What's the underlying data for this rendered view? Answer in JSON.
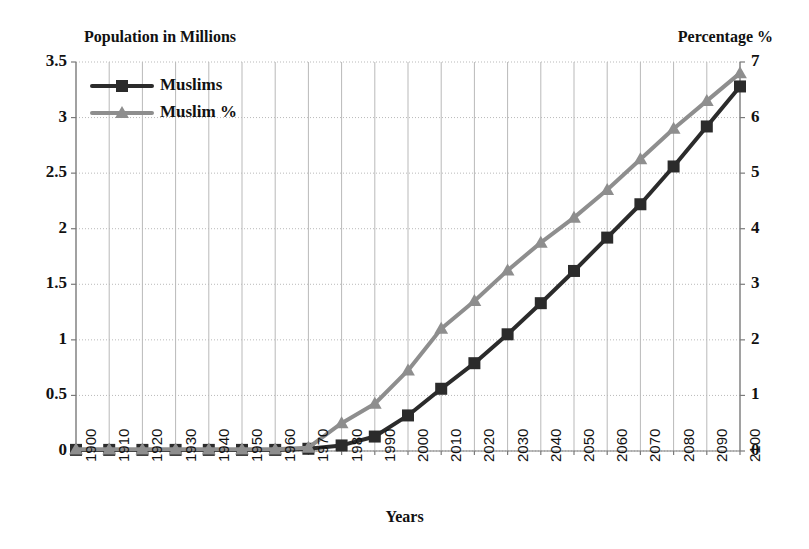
{
  "chart_data": {
    "type": "line",
    "title": "",
    "xlabel": "Years",
    "ylabel": "Population in Millions",
    "y2label": "Percentage %",
    "grid": true,
    "legend_position": "top-left-inside",
    "xlim": [
      1900,
      2100
    ],
    "ylim": [
      0,
      3.5
    ],
    "y2lim": [
      0,
      7
    ],
    "yticks": [
      "0",
      "0.5",
      "1",
      "1.5",
      "2",
      "2.5",
      "3",
      "3.5"
    ],
    "ytick_values": [
      0,
      0.5,
      1,
      1.5,
      2,
      2.5,
      3,
      3.5
    ],
    "y2ticks": [
      "0",
      "1",
      "2",
      "3",
      "4",
      "5",
      "6",
      "7"
    ],
    "y2tick_values": [
      0,
      1,
      2,
      3,
      4,
      5,
      6,
      7
    ],
    "categories": [
      "1900",
      "1910",
      "1920",
      "1930",
      "1940",
      "1950",
      "1960",
      "1970",
      "1980",
      "1990",
      "2000",
      "2010",
      "2020",
      "2030",
      "2040",
      "2050",
      "2060",
      "2070",
      "2080",
      "2090",
      "2100"
    ],
    "x": [
      1900,
      1910,
      1920,
      1930,
      1940,
      1950,
      1960,
      1970,
      1980,
      1990,
      2000,
      2010,
      2020,
      2030,
      2040,
      2050,
      2060,
      2070,
      2080,
      2090,
      2100
    ],
    "series": [
      {
        "name": "Muslims",
        "axis": "left",
        "color": "#2b2b2b",
        "marker": "square",
        "unit": "millions",
        "values": [
          0.01,
          0.01,
          0.01,
          0.01,
          0.01,
          0.01,
          0.01,
          0.02,
          0.05,
          0.13,
          0.32,
          0.56,
          0.79,
          1.05,
          1.33,
          1.62,
          1.92,
          2.22,
          2.56,
          2.92,
          3.28
        ]
      },
      {
        "name": "Muslim %",
        "axis": "right",
        "color": "#8e8e8e",
        "marker": "triangle",
        "unit": "percent",
        "values": [
          0.03,
          0.03,
          0.03,
          0.03,
          0.03,
          0.03,
          0.03,
          0.06,
          0.5,
          0.85,
          1.45,
          2.2,
          2.7,
          3.25,
          3.75,
          4.2,
          4.7,
          5.25,
          5.8,
          6.3,
          6.8
        ]
      }
    ]
  },
  "legend": {
    "items": [
      {
        "label": "Muslims",
        "color": "#2b2b2b",
        "marker": "square"
      },
      {
        "label": "Muslim %",
        "color": "#8e8e8e",
        "marker": "triangle"
      }
    ]
  },
  "axes": {
    "left_title": "Population in Millions",
    "right_title": "Percentage %",
    "x_title": "Years"
  },
  "colors": {
    "muslims_line": "#2b2b2b",
    "muslim_pct_line": "#8e8e8e",
    "grid": "#b9b9b9",
    "axis": "#7a7a7a",
    "background": "#ffffff"
  }
}
